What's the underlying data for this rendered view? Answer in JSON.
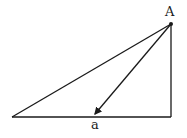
{
  "diagram": {
    "type": "right-triangle-with-vector",
    "stroke_color": "#1a1a1a",
    "background": "#ffffff",
    "vertices": {
      "apex": {
        "label": "A",
        "x": 171,
        "y": 24
      },
      "bottom_left": {
        "x": 12,
        "y": 117
      },
      "bottom_right": {
        "x": 171,
        "y": 117
      }
    },
    "arrow": {
      "from": "A",
      "to_x": 94,
      "to_y": 115,
      "label": "a"
    },
    "labels": {
      "apex": "A",
      "arrow": "a"
    }
  }
}
